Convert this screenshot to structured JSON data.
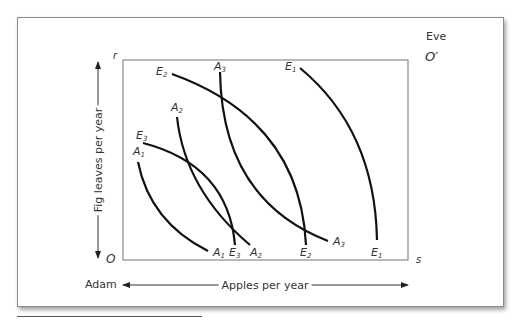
{
  "diagram": {
    "type": "edgeworth-box",
    "owners": {
      "origin_bottom_left": "Adam",
      "origin_top_right": "Eve"
    },
    "corner_labels": {
      "bottom_left": "O",
      "top_right": "O′",
      "top_left": "r",
      "bottom_right": "s"
    },
    "axes": {
      "x_label": "Apples per year",
      "y_label": "Fig leaves per year"
    },
    "curves": [
      {
        "id": "A1",
        "owner": "Adam",
        "label": "A",
        "sub": "1",
        "top": [
          138,
          162
        ],
        "bottom": [
          208,
          251
        ]
      },
      {
        "id": "A2",
        "owner": "Adam",
        "label": "A",
        "sub": "2",
        "top": [
          177,
          117
        ],
        "bottom": [
          250,
          245
        ]
      },
      {
        "id": "A3",
        "owner": "Adam",
        "label": "A",
        "sub": "3",
        "top": [
          220,
          72
        ],
        "bottom": [
          328,
          241
        ]
      },
      {
        "id": "E1",
        "owner": "Eve",
        "label": "E",
        "sub": "1",
        "top": [
          300,
          68
        ],
        "bottom": [
          377,
          240
        ]
      },
      {
        "id": "E2",
        "owner": "Eve",
        "label": "E",
        "sub": "2",
        "top": [
          172,
          74
        ],
        "bottom": [
          306,
          245
        ]
      },
      {
        "id": "E3",
        "owner": "Eve",
        "label": "E",
        "sub": "3",
        "top": [
          143,
          143
        ],
        "bottom": [
          235,
          245
        ]
      }
    ]
  },
  "labels": {
    "eve": "Eve",
    "adam": "Adam",
    "r": "r",
    "o": "O",
    "o_prime": "O′",
    "s": "s",
    "x_axis": "Apples per year",
    "y_axis": "Fig leaves per year",
    "A": "A",
    "E": "E",
    "sub1": "1",
    "sub2": "2",
    "sub3": "3"
  },
  "colors": {
    "curve": "#111111",
    "box": "#8a8a8a",
    "text": "#333333"
  }
}
